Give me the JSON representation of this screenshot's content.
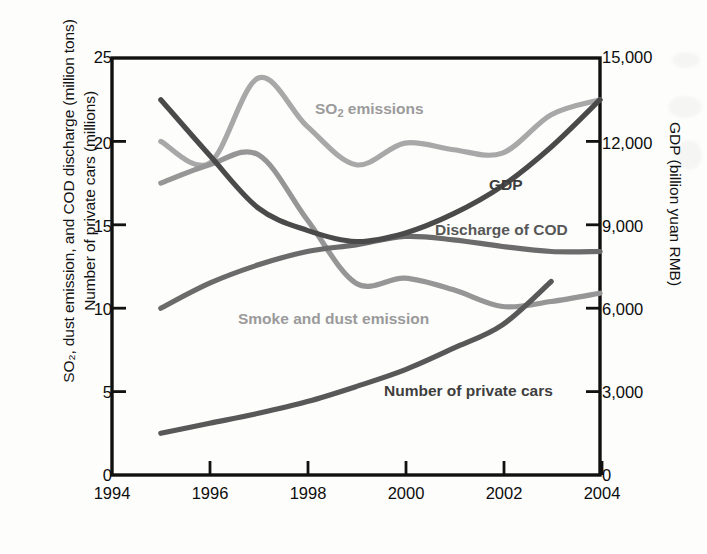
{
  "axes": {
    "left_title_line1": "SO₂, dust emission, and COD discharge (million tons)",
    "left_title_line2": "Number of private cars (millions)",
    "right_title": "GDP (billion yuan RMB)",
    "left_ticks": [
      "0",
      "5",
      "10",
      "15",
      "20",
      "25"
    ],
    "right_ticks": [
      "0",
      "3,000",
      "6,000",
      "9,000",
      "12,000",
      "15,000"
    ],
    "x_ticks": [
      "1994",
      "1996",
      "1998",
      "2000",
      "2002",
      "2004"
    ]
  },
  "labels": {
    "so2": "SO",
    "so2_sub": "2",
    "so2_tail": " emissions",
    "gdp": "GDP",
    "cod": "Discharge of COD",
    "smoke": "Smoke and dust emission",
    "cars": "Number of private cars"
  },
  "colors": {
    "so2": "#a8a8a8",
    "smoke": "#969696",
    "cod": "#6b6b6b",
    "gdp": "#4a4a4a",
    "cars": "#585858",
    "axis": "#111111",
    "background": "#fdfdfc"
  },
  "chart_data": {
    "type": "line",
    "title": "",
    "xlabel": "",
    "ylabel": "SO₂, dust emission, and COD discharge (million tons) / Number of private cars (millions)",
    "y2label": "GDP (billion yuan RMB)",
    "xlim": [
      1994,
      2004
    ],
    "ylim": [
      0,
      25
    ],
    "y2lim": [
      0,
      15000
    ],
    "grid": false,
    "legend": "inline-labels",
    "x": [
      1995,
      1996,
      1997,
      1998,
      1999,
      2000,
      2001,
      2002,
      2003,
      2004
    ],
    "series": [
      {
        "name": "SO₂ emissions",
        "axis": "left",
        "units": "million tons",
        "color": "#a8a8a8",
        "values": [
          20.0,
          18.7,
          23.8,
          20.9,
          18.6,
          19.9,
          19.5,
          19.3,
          21.6,
          22.5
        ]
      },
      {
        "name": "Smoke and dust emission",
        "axis": "left",
        "units": "million tons",
        "color": "#969696",
        "values": [
          17.5,
          18.6,
          19.2,
          15.3,
          11.5,
          11.8,
          11.1,
          10.1,
          10.4,
          10.9
        ]
      },
      {
        "name": "Discharge of COD",
        "axis": "left",
        "units": "million tons",
        "color": "#6b6b6b",
        "values": [
          10.0,
          11.5,
          12.6,
          13.4,
          13.8,
          14.3,
          14.1,
          13.7,
          13.4,
          13.4
        ]
      },
      {
        "name": "GDP",
        "axis": "right",
        "units": "billion yuan RMB",
        "color": "#4a4a4a",
        "values": [
          13500,
          11500,
          9600,
          8800,
          8400,
          8700,
          9400,
          10400,
          11800,
          13500
        ],
        "note": "plotted descending 1995-1999 then ascending to 2004 as drawn"
      },
      {
        "name": "Number of private cars",
        "axis": "left",
        "units": "millions",
        "color": "#585858",
        "values": [
          2.5,
          3.1,
          3.7,
          4.4,
          5.3,
          6.3,
          7.6,
          9.0,
          11.6,
          null
        ]
      }
    ]
  }
}
